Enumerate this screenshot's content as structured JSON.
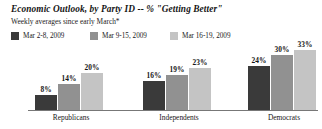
{
  "chart_data": {
    "type": "bar",
    "title": "Economic Outlook, by Party ID -- % \"Getting Better\"",
    "subtitle": "Weekly averages since early March*",
    "xlabel": "",
    "ylabel": "",
    "ylim": [
      0,
      35
    ],
    "grid": false,
    "legend_position": "top-left",
    "categories": [
      "Republicans",
      "Independents",
      "Democrats"
    ],
    "series": [
      {
        "name": "Mar 2-8, 2009",
        "color": "#3a3a3a",
        "values": [
          8,
          16,
          24
        ],
        "labels": [
          "8%",
          "16%",
          "24%"
        ]
      },
      {
        "name": "Mar 9-15, 2009",
        "color": "#919191",
        "values": [
          14,
          19,
          30
        ],
        "labels": [
          "14%",
          "19%",
          "30%"
        ]
      },
      {
        "name": "Mar 16-19, 2009",
        "color": "#c4c4c4",
        "values": [
          20,
          23,
          33
        ],
        "labels": [
          "20%",
          "23%",
          "33%"
        ]
      }
    ]
  }
}
